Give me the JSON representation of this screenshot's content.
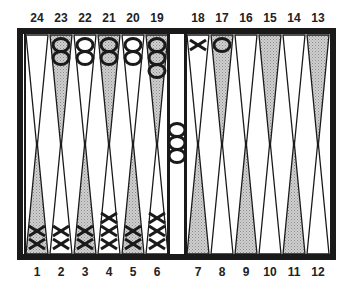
{
  "board": {
    "top_labels": [
      "24",
      "23",
      "22",
      "21",
      "20",
      "19",
      "18",
      "17",
      "16",
      "15",
      "14",
      "13"
    ],
    "bottom_labels": [
      "1",
      "2",
      "3",
      "4",
      "5",
      "6",
      "7",
      "8",
      "9",
      "10",
      "11",
      "12"
    ],
    "colors": {
      "frame": "#1a1a1a",
      "shaded_point": "#bdbdbd",
      "light_point": "#ffffff",
      "stone": "#1a1a1a"
    },
    "shaded_points_top": [
      "23",
      "21",
      "19",
      "17",
      "15",
      "13"
    ],
    "shaded_points_bottom": [
      "1",
      "3",
      "5",
      "7",
      "9",
      "11"
    ],
    "checkers": [
      {
        "point": "23",
        "type": "O",
        "count": 2
      },
      {
        "point": "22",
        "type": "O",
        "count": 2
      },
      {
        "point": "21",
        "type": "O",
        "count": 2
      },
      {
        "point": "20",
        "type": "O",
        "count": 2
      },
      {
        "point": "19",
        "type": "O",
        "count": 3
      },
      {
        "point": "18",
        "type": "X",
        "count": 1
      },
      {
        "point": "17",
        "type": "O",
        "count": 1
      },
      {
        "point": "1",
        "type": "X",
        "count": 2
      },
      {
        "point": "2",
        "type": "X",
        "count": 2
      },
      {
        "point": "3",
        "type": "X",
        "count": 2
      },
      {
        "point": "4",
        "type": "X",
        "count": 3
      },
      {
        "point": "5",
        "type": "X",
        "count": 2
      },
      {
        "point": "6",
        "type": "X",
        "count": 3
      }
    ],
    "bar": {
      "type": "O",
      "count": 3
    }
  }
}
